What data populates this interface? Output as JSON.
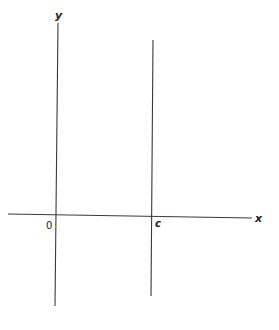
{
  "diagram": {
    "axes": {
      "x_label": "x",
      "y_label": "y",
      "origin_label": "0"
    },
    "vertical_line": {
      "label": "c"
    },
    "colors": {
      "line": "#3a3a3a",
      "text": "#222222",
      "background": "#ffffff"
    }
  }
}
